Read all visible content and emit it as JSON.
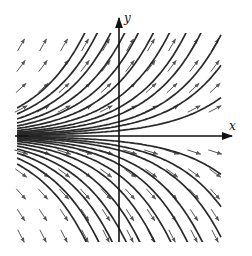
{
  "diagram": {
    "type": "direction-field",
    "axes": {
      "x_label": "x",
      "y_label": "y"
    },
    "colors": {
      "curve": "#2a2a2a",
      "axis": "#111111",
      "arrow": "#555555",
      "background": "#ffffff"
    },
    "frame": {
      "left": 17,
      "top": 33,
      "right": 222,
      "bottom": 242
    },
    "origin_px": {
      "x": 119,
      "y": 136
    },
    "unit_px": 52,
    "curve_left_offsets": [
      28,
      22,
      17,
      13,
      10,
      7.5,
      5.5,
      4,
      3,
      2,
      1.4,
      0.76
    ],
    "arrow_grid": {
      "columns": [
        21,
        43,
        64,
        85,
        106,
        130,
        151,
        172,
        194,
        215
      ],
      "rows": [
        45,
        66,
        88,
        109,
        152,
        173,
        194,
        215,
        236
      ],
      "length": 14
    }
  }
}
